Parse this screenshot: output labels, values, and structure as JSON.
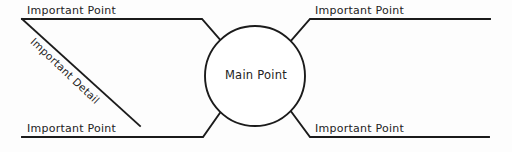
{
  "diagram": {
    "type": "radial-concept-map",
    "center": {
      "id": "main-point",
      "label": "Main Point",
      "shape": "circle",
      "cx": 255,
      "cy": 76,
      "r": 50
    },
    "branches": [
      {
        "id": "branch-top-left",
        "label": "Important Point",
        "position": "top-left",
        "label_x": 27,
        "label_y": 5,
        "underline_y": 19,
        "underline_x_start": 22,
        "underline_x_end": 202,
        "elbow_x": 202,
        "elbow_y": 19,
        "attach_x": 222,
        "attach_y": 42
      },
      {
        "id": "branch-top-right",
        "label": "Important Point",
        "position": "top-right",
        "label_x": 315,
        "label_y": 5,
        "underline_y": 19,
        "underline_x_start": 310,
        "underline_x_end": 490,
        "elbow_x": 310,
        "elbow_y": 19,
        "attach_x": 290,
        "attach_y": 42
      },
      {
        "id": "branch-bottom-left",
        "label": "Important Point",
        "position": "bottom-left",
        "label_x": 27,
        "label_y": 123,
        "underline_y": 137,
        "underline_x_start": 22,
        "underline_x_end": 203,
        "elbow_x": 203,
        "elbow_y": 137,
        "attach_x": 222,
        "attach_y": 110
      },
      {
        "id": "branch-bottom-right",
        "label": "Important Point",
        "position": "bottom-right",
        "label_x": 315,
        "label_y": 123,
        "underline_y": 137,
        "underline_x_start": 310,
        "underline_x_end": 489,
        "elbow_x": 310,
        "elbow_y": 137,
        "attach_x": 290,
        "attach_y": 110
      }
    ],
    "sub_branches": [
      {
        "id": "detail-top-left",
        "label": "Important Detail",
        "parent": "branch-top-left",
        "from_x": 22,
        "from_y": 19,
        "to_x": 140,
        "to_y": 126,
        "rotation_deg": 43.5
      }
    ],
    "style": {
      "line_color": "#1b1b1b",
      "text_color": "#232323",
      "background_color": "#fdfdfd",
      "node_fill": "#ffffff",
      "stroke_width": 1.9
    }
  }
}
